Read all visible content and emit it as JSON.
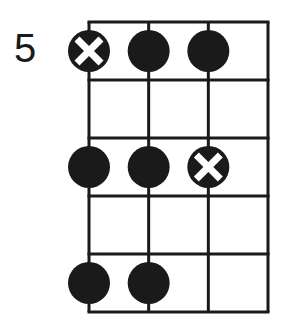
{
  "diagram": {
    "type": "fretboard-chord-diagram",
    "start_fret_label": "5",
    "strings": 4,
    "frets": 5,
    "colors": {
      "line": "#1a1a1a",
      "dot": "#1a1a1a",
      "root_mark": "#ffffff",
      "background": "#ffffff"
    },
    "notes": [
      {
        "string": 1,
        "fret": 1,
        "marker": "root-x"
      },
      {
        "string": 2,
        "fret": 1,
        "marker": "dot"
      },
      {
        "string": 3,
        "fret": 1,
        "marker": "dot"
      },
      {
        "string": 1,
        "fret": 3,
        "marker": "dot"
      },
      {
        "string": 2,
        "fret": 3,
        "marker": "dot"
      },
      {
        "string": 3,
        "fret": 3,
        "marker": "root-x"
      },
      {
        "string": 1,
        "fret": 5,
        "marker": "dot"
      },
      {
        "string": 2,
        "fret": 5,
        "marker": "dot"
      }
    ]
  }
}
